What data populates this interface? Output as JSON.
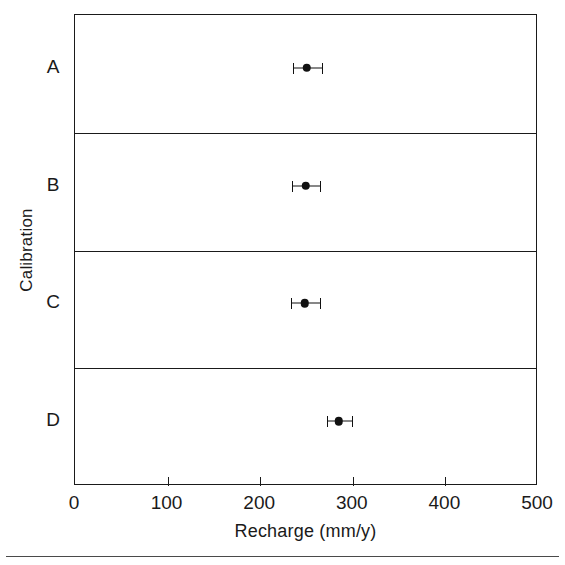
{
  "chart_data": {
    "type": "scatter",
    "title": "",
    "subtitle": "",
    "xlabel": "Recharge (mm/y)",
    "ylabel": "Calibration",
    "xlim": [
      0,
      500
    ],
    "xticks": [
      0,
      100,
      200,
      300,
      400,
      500
    ],
    "xticklabels": [
      "0",
      "100",
      "200",
      "300",
      "400",
      "500"
    ],
    "grid": false,
    "legend": null,
    "categories": [
      "A",
      "B",
      "C",
      "D"
    ],
    "orientation": "horizontal",
    "panels": 4,
    "series": [
      {
        "name": "Recharge estimate",
        "values": [
          250,
          249,
          248,
          285
        ],
        "error_low": [
          235,
          234,
          233,
          272
        ],
        "error_high": [
          268,
          266,
          266,
          300
        ],
        "error_minus": [
          15,
          15,
          15,
          13
        ],
        "error_plus": [
          18,
          17,
          18,
          15
        ]
      }
    ],
    "points": [
      {
        "category": "A",
        "value": 250,
        "low": 235,
        "high": 268
      },
      {
        "category": "B",
        "value": 249,
        "low": 234,
        "high": 266
      },
      {
        "category": "C",
        "value": 248,
        "low": 233,
        "high": 266
      },
      {
        "category": "D",
        "value": 285,
        "low": 272,
        "high": 300
      }
    ],
    "marker_color": "#111111",
    "axis_color": "#1a1a1a"
  }
}
